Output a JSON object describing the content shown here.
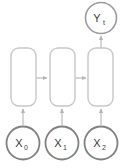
{
  "diagram": {
    "canvas": {
      "width": 124,
      "height": 168,
      "background": "#ffffff"
    },
    "colors": {
      "input_node_stroke": "#808080",
      "output_node_stroke": "#9a9a9a",
      "cell_stroke": "#c8c8c8",
      "arrow_stroke": "#b4b4b4",
      "label_text": "#3a3a3a",
      "node_fill": "#ffffff"
    },
    "inputs": [
      {
        "id": "x0",
        "base": "X",
        "subscript": "0",
        "text": "X0",
        "cx": 23,
        "cy": 143,
        "r": 17
      },
      {
        "id": "x1",
        "base": "X",
        "subscript": "1",
        "text": "X1",
        "cx": 62,
        "cy": 143,
        "r": 17
      },
      {
        "id": "x2",
        "base": "X",
        "subscript": "2",
        "text": "X2",
        "cx": 101,
        "cy": 143,
        "r": 17
      }
    ],
    "cells": [
      {
        "id": "cell0",
        "x": 11,
        "y": 48,
        "width": 25,
        "height": 58,
        "radius": 8
      },
      {
        "id": "cell1",
        "x": 50,
        "y": 48,
        "width": 25,
        "height": 58,
        "radius": 8
      },
      {
        "id": "cell2",
        "x": 88,
        "y": 48,
        "width": 25,
        "height": 58,
        "radius": 8
      }
    ],
    "output": {
      "id": "yt",
      "base": "Y",
      "subscript": "t",
      "text": "Yt",
      "cx": 101,
      "cy": 18,
      "r": 16
    },
    "arrows": [
      {
        "id": "x0-to-cell0",
        "from": "x0",
        "to": "cell0",
        "direction": "up"
      },
      {
        "id": "x1-to-cell1",
        "from": "x1",
        "to": "cell1",
        "direction": "up"
      },
      {
        "id": "x2-to-cell2",
        "from": "x2",
        "to": "cell2",
        "direction": "up"
      },
      {
        "id": "cell0-to-cell1",
        "from": "cell0",
        "to": "cell1",
        "direction": "right"
      },
      {
        "id": "cell1-to-cell2",
        "from": "cell1",
        "to": "cell2",
        "direction": "right"
      },
      {
        "id": "cell2-to-yt",
        "from": "cell2",
        "to": "yt",
        "direction": "up"
      }
    ]
  }
}
